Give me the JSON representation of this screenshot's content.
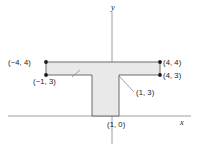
{
  "figure": {
    "type": "coordinate-geometry-diagram",
    "background_color": "#ffffff",
    "axes": {
      "x_label": "x",
      "y_label": "y",
      "axis_color": "#9a9a9a",
      "origin_px": [
        112,
        116
      ],
      "x_axis_pixel_y": 116,
      "y_axis_pixel_x": 112,
      "units_per_pixel_x": 0.0729,
      "units_per_pixel_y": 0.0741
    },
    "shape": {
      "name": "t-shaped-polygon",
      "fill_color": "#e9e9e9",
      "stroke_color": "#6b6b6b",
      "vertices": [
        {
          "x": -4,
          "y": 4
        },
        {
          "x": 4,
          "y": 4
        },
        {
          "x": 4,
          "y": 3
        },
        {
          "x": 1,
          "y": 3
        },
        {
          "x": 1,
          "y": 0
        },
        {
          "x": -1,
          "y": 0
        },
        {
          "x": -1,
          "y": 3
        },
        {
          "x": -4,
          "y": 3
        }
      ]
    },
    "markers": [
      {
        "x": -4,
        "y": 4,
        "color": "#1a1a1a"
      },
      {
        "x": -4,
        "y": 3,
        "color": "#1a1a1a"
      },
      {
        "x": 4,
        "y": 4,
        "color": "#1a1a1a"
      },
      {
        "x": 4,
        "y": 3,
        "color": "#1a1a1a"
      }
    ],
    "point_labels": [
      {
        "id": "v-neg4-4",
        "text": "(−4, 4)",
        "anchor": "right"
      },
      {
        "id": "v-neg1-3",
        "text": "(−1, 3)",
        "anchor": "left"
      },
      {
        "id": "v-4-4",
        "text": "(4, 4)",
        "anchor": "left"
      },
      {
        "id": "v-4-3",
        "text": "(4, 3)",
        "anchor": "left"
      },
      {
        "id": "v-1-3",
        "text": "(1, 3)",
        "anchor": "left"
      },
      {
        "id": "v-1-0",
        "text": "(1, 0)",
        "anchor": "left"
      }
    ],
    "leader_lines": [
      {
        "from_label": "v-neg1-3",
        "from_px": [
          72,
          77
        ],
        "to_px": [
          80,
          70
        ]
      },
      {
        "from_label": "v-1-3",
        "from_px": [
          134,
          92
        ],
        "to_px": [
          119,
          76
        ]
      }
    ]
  }
}
